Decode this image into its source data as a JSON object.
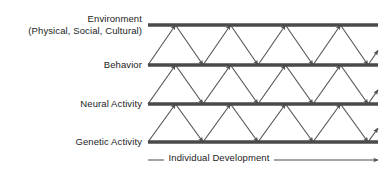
{
  "diagram": {
    "levels": [
      {
        "id": "environment",
        "label": "Environment",
        "sublabel": "(Physical, Social, Cultural)",
        "bar_y": 25
      },
      {
        "id": "behavior",
        "label": "Behavior",
        "sublabel": "",
        "bar_y": 65
      },
      {
        "id": "neural",
        "label": "Neural Activity",
        "sublabel": "",
        "bar_y": 104
      },
      {
        "id": "genetic",
        "label": "Genetic Activity",
        "sublabel": "",
        "bar_y": 142
      }
    ],
    "axis": {
      "caption": "Individual Development",
      "direction": "right"
    },
    "colors": {
      "bar": "#4a4a4a",
      "arrow": "#555555",
      "text": "#1c1c1c",
      "background": "#ffffff"
    },
    "geometry": {
      "bar_left": 148,
      "bar_right": 378,
      "bar_thickness": 3.5,
      "zigzag_period": 55,
      "zigzag_phase_offset": 27.5,
      "axis_y": 160
    }
  }
}
